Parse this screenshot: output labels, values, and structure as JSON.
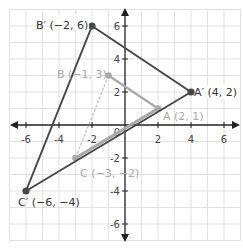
{
  "diagram": {
    "type": "coordinate-plane-dilation",
    "axes": {
      "x_ticks": [
        "-6",
        "-4",
        "-2",
        "2",
        "4",
        "6"
      ],
      "y_ticks": [
        "6",
        "4",
        "2",
        "-2",
        "-4",
        "-6"
      ],
      "origin_label": "0",
      "range": [
        -7,
        7
      ]
    },
    "original_triangle": {
      "color": "#a9a9a9",
      "points": [
        {
          "name": "A",
          "x": 2,
          "y": 1,
          "label": "A (2, 1)"
        },
        {
          "name": "B",
          "x": -1,
          "y": 3,
          "label": "B (−1, 3)"
        },
        {
          "name": "C",
          "x": -3,
          "y": -2,
          "label": "C (−3, −2)"
        }
      ]
    },
    "image_triangle": {
      "color": "#474747",
      "points": [
        {
          "name": "A'",
          "x": 4,
          "y": 2,
          "label": "A′ (4, 2)"
        },
        {
          "name": "B'",
          "x": -2,
          "y": 6,
          "label": "B′ (−2, 6)"
        },
        {
          "name": "C'",
          "x": -6,
          "y": -4,
          "label": "C′ (−6, −4)"
        }
      ]
    }
  }
}
